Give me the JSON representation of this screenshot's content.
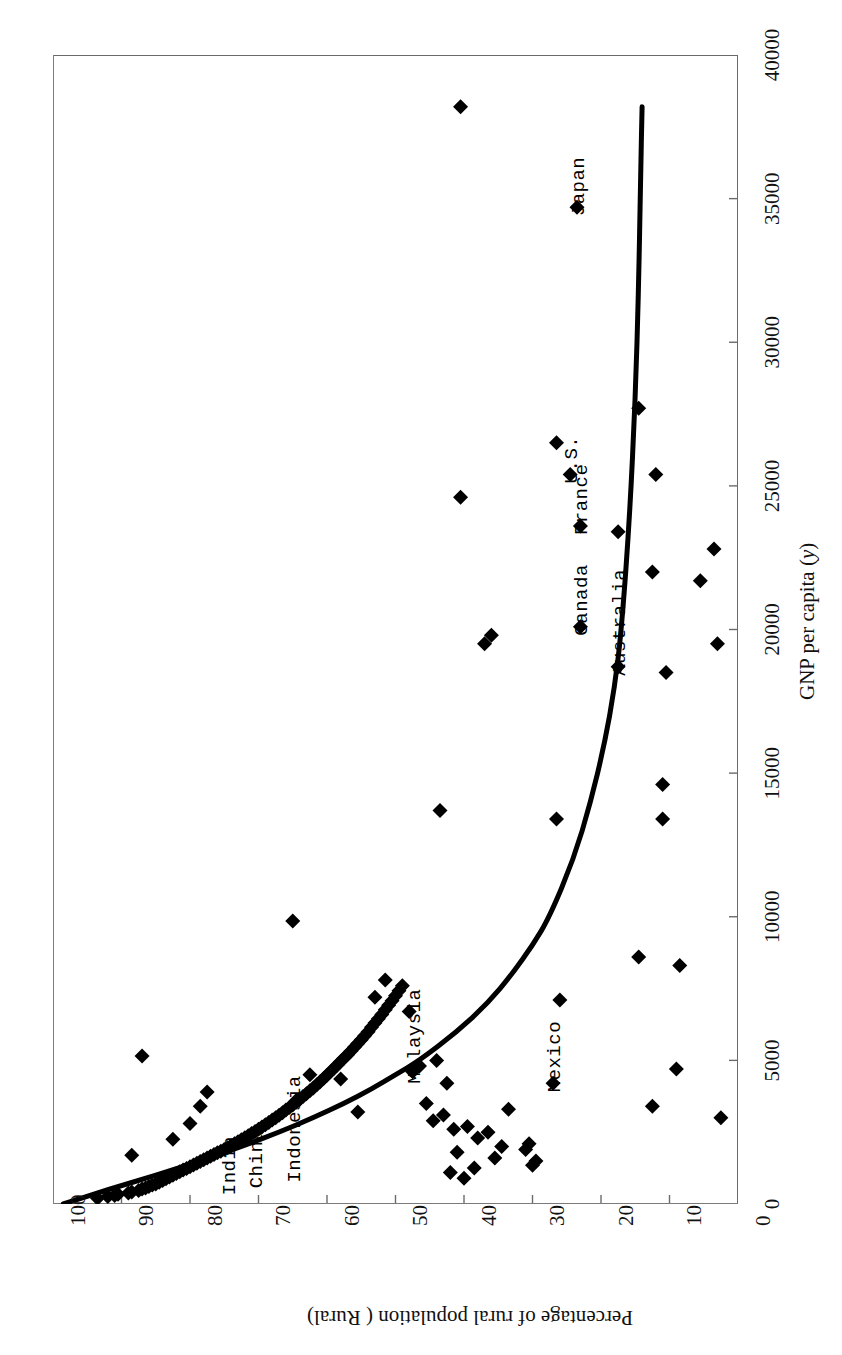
{
  "figure": {
    "orientation": "rotated-90",
    "background": "#ffffff",
    "frame_color": "#6b6b6b",
    "marker_color": "#000000",
    "curve_color": "#000000"
  },
  "chart_data": {
    "type": "scatter",
    "title": "",
    "xlabel": "GNP per capita (y)",
    "xlabel_plain": "GNP per capita",
    "xlabel_symbol": "y",
    "ylabel": "Percentage of rural population ( Rural)",
    "xlim": [
      0,
      40000
    ],
    "ylim": [
      0,
      100
    ],
    "xticks": [
      0,
      5000,
      10000,
      15000,
      20000,
      25000,
      30000,
      35000,
      40000
    ],
    "xtick_labels": [
      "0",
      "5000",
      "10000",
      "15000",
      "20000",
      "25000",
      "30000",
      "35000",
      "40000"
    ],
    "yticks": [
      0,
      10,
      20,
      30,
      40,
      50,
      60,
      70,
      80,
      90,
      100
    ],
    "ytick_labels": [
      "0",
      "10",
      "20",
      "30",
      "40",
      "50",
      "60",
      "70",
      "80",
      "90",
      "100"
    ],
    "grid": false,
    "legend": "none",
    "series": [
      {
        "name": "Countries",
        "marker": "diamond",
        "points": [
          [
            200,
            93.5
          ],
          [
            260,
            92.0
          ],
          [
            300,
            91.0
          ],
          [
            340,
            90.5
          ],
          [
            380,
            89.0
          ],
          [
            420,
            88.5
          ],
          [
            470,
            87.5
          ],
          [
            520,
            87.0
          ],
          [
            560,
            86.5
          ],
          [
            610,
            86.0
          ],
          [
            660,
            85.5
          ],
          [
            700,
            85.0
          ],
          [
            760,
            84.5
          ],
          [
            820,
            84.0
          ],
          [
            880,
            83.5
          ],
          [
            940,
            83.0
          ],
          [
            1000,
            82.5
          ],
          [
            1060,
            82.0
          ],
          [
            1120,
            81.5
          ],
          [
            1180,
            81.0
          ],
          [
            1240,
            80.5
          ],
          [
            1300,
            80.0
          ],
          [
            1360,
            79.5
          ],
          [
            1420,
            79.0
          ],
          [
            1480,
            78.5
          ],
          [
            1540,
            78.0
          ],
          [
            1600,
            77.5
          ],
          [
            1660,
            77.0
          ],
          [
            1720,
            76.5
          ],
          [
            1780,
            76.0
          ],
          [
            1840,
            75.5
          ],
          [
            1900,
            75.0
          ],
          [
            1960,
            74.5
          ],
          [
            2030,
            74.0
          ],
          [
            2100,
            73.5
          ],
          [
            2170,
            73.0
          ],
          [
            2240,
            72.5
          ],
          [
            2310,
            72.0
          ],
          [
            2380,
            71.5
          ],
          [
            2450,
            71.0
          ],
          [
            2520,
            70.5
          ],
          [
            2600,
            70.0
          ],
          [
            2680,
            69.5
          ],
          [
            2760,
            69.0
          ],
          [
            2840,
            68.5
          ],
          [
            2920,
            68.0
          ],
          [
            3000,
            67.5
          ],
          [
            3090,
            67.0
          ],
          [
            3180,
            66.5
          ],
          [
            3270,
            66.0
          ],
          [
            3360,
            65.5
          ],
          [
            3450,
            65.0
          ],
          [
            3540,
            64.5
          ],
          [
            3640,
            64.0
          ],
          [
            3740,
            63.5
          ],
          [
            3840,
            63.0
          ],
          [
            3940,
            62.5
          ],
          [
            4040,
            62.0
          ],
          [
            4150,
            61.5
          ],
          [
            4260,
            61.0
          ],
          [
            4370,
            60.5
          ],
          [
            4480,
            60.0
          ],
          [
            4600,
            59.5
          ],
          [
            4720,
            59.0
          ],
          [
            4840,
            58.5
          ],
          [
            4960,
            58.0
          ],
          [
            5080,
            57.5
          ],
          [
            5200,
            57.0
          ],
          [
            5330,
            56.5
          ],
          [
            5460,
            56.0
          ],
          [
            5590,
            55.5
          ],
          [
            5720,
            55.0
          ],
          [
            5860,
            54.5
          ],
          [
            6000,
            54.0
          ],
          [
            6150,
            53.5
          ],
          [
            6300,
            53.0
          ],
          [
            6450,
            52.5
          ],
          [
            6600,
            52.0
          ],
          [
            6760,
            51.5
          ],
          [
            6920,
            51.0
          ],
          [
            7080,
            50.5
          ],
          [
            7250,
            50.0
          ],
          [
            7420,
            49.5
          ],
          [
            7600,
            49.0
          ],
          [
            5150,
            87.0
          ],
          [
            1700,
            88.5
          ],
          [
            2250,
            82.5
          ],
          [
            3400,
            78.5
          ],
          [
            3900,
            77.5
          ],
          [
            2800,
            80.0
          ],
          [
            9850,
            65.0
          ],
          [
            3600,
            64.5
          ],
          [
            4500,
            62.5
          ],
          [
            4350,
            58.0
          ],
          [
            3200,
            55.5
          ],
          [
            7200,
            53.0
          ],
          [
            7800,
            51.5
          ],
          [
            6700,
            48.0
          ],
          [
            4600,
            47.5
          ],
          [
            4800,
            46.5
          ],
          [
            3500,
            45.5
          ],
          [
            2900,
            44.5
          ],
          [
            5000,
            44.0
          ],
          [
            3100,
            43.0
          ],
          [
            4200,
            42.5
          ],
          [
            2600,
            41.5
          ],
          [
            13700,
            43.5
          ],
          [
            19500,
            37.0
          ],
          [
            19800,
            36.0
          ],
          [
            24600,
            40.5
          ],
          [
            38200,
            40.5
          ],
          [
            34700,
            23.5
          ],
          [
            26500,
            26.5
          ],
          [
            25400,
            24.5
          ],
          [
            23400,
            17.5
          ],
          [
            23600,
            23.0
          ],
          [
            20100,
            23.0
          ],
          [
            18700,
            17.5
          ],
          [
            27700,
            14.5
          ],
          [
            25400,
            12.0
          ],
          [
            22000,
            12.5
          ],
          [
            21700,
            5.5
          ],
          [
            22800,
            3.5
          ],
          [
            19500,
            3.0
          ],
          [
            18500,
            10.5
          ],
          [
            14600,
            11.0
          ],
          [
            13400,
            11.0
          ],
          [
            13400,
            26.5
          ],
          [
            8600,
            14.5
          ],
          [
            8300,
            8.5
          ],
          [
            7100,
            26.0
          ],
          [
            4700,
            9.0
          ],
          [
            3400,
            12.5
          ],
          [
            4200,
            27.0
          ],
          [
            3000,
            2.5
          ],
          [
            3300,
            33.5
          ],
          [
            2100,
            30.5
          ],
          [
            1900,
            31.0
          ],
          [
            1500,
            29.5
          ],
          [
            1350,
            30.0
          ],
          [
            2500,
            36.5
          ],
          [
            2300,
            38.0
          ],
          [
            2700,
            39.5
          ],
          [
            1800,
            41.0
          ],
          [
            1250,
            38.5
          ],
          [
            1600,
            35.5
          ],
          [
            2000,
            34.5
          ],
          [
            900,
            40.0
          ],
          [
            1100,
            42.0
          ]
        ]
      }
    ],
    "fit_curve": {
      "type": "exponential-decay",
      "description": "Percentage rural population declines exponentially as GNP per capita rises",
      "points": [
        [
          0,
          98.5
        ],
        [
          500,
          92.0
        ],
        [
          1000,
          85.0
        ],
        [
          1500,
          78.5
        ],
        [
          2000,
          72.5
        ],
        [
          2500,
          67.0
        ],
        [
          3000,
          62.0
        ],
        [
          3500,
          57.5
        ],
        [
          4000,
          53.5
        ],
        [
          4500,
          50.0
        ],
        [
          5000,
          46.5
        ],
        [
          6000,
          41.0
        ],
        [
          7000,
          36.5
        ],
        [
          8000,
          33.0
        ],
        [
          9000,
          30.0
        ],
        [
          10000,
          27.5
        ],
        [
          12000,
          24.0
        ],
        [
          14000,
          21.5
        ],
        [
          16000,
          19.5
        ],
        [
          18000,
          18.0
        ],
        [
          20000,
          17.0
        ],
        [
          24000,
          15.8
        ],
        [
          28000,
          15.0
        ],
        [
          32000,
          14.5
        ],
        [
          36000,
          14.2
        ],
        [
          38200,
          14.0
        ]
      ]
    },
    "annotations": [
      {
        "label": "Japan",
        "x": 34700,
        "y": 23.5,
        "anchor": "above"
      },
      {
        "label": "U.S.",
        "x": 25400,
        "y": 24.5,
        "anchor": "above"
      },
      {
        "label": "France",
        "x": 23600,
        "y": 23.0,
        "anchor": "above"
      },
      {
        "label": "Canada",
        "x": 20100,
        "y": 23.0,
        "anchor": "above"
      },
      {
        "label": "Australia",
        "x": 18700,
        "y": 17.5,
        "anchor": "above"
      },
      {
        "label": "Mexico",
        "x": 4200,
        "y": 27.0,
        "anchor": "above"
      },
      {
        "label": "Malaysia",
        "x": 4500,
        "y": 47.5,
        "anchor": "above"
      },
      {
        "label": "Indonesia",
        "x": 1060,
        "y": 65.0,
        "anchor": "above"
      },
      {
        "label": "China",
        "x": 860,
        "y": 70.5,
        "anchor": "above"
      },
      {
        "label": "India",
        "x": 620,
        "y": 74.5,
        "anchor": "above"
      }
    ]
  }
}
